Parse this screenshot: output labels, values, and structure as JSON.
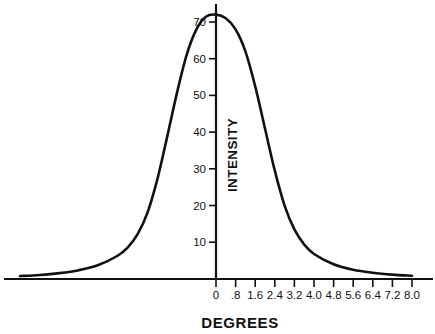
{
  "chart_data": {
    "type": "line",
    "title": "",
    "subtitle": "",
    "xlabel": "DEGREES",
    "ylabel": "INTENSITY",
    "xlim": [
      -8.0,
      8.0
    ],
    "ylim": [
      0,
      75
    ],
    "grid": false,
    "legend": null,
    "annotations": [],
    "line_color": "#111111",
    "axis_color": "#111111",
    "background_color": "#ffffff",
    "x_tick_labels": [
      "0",
      ".8",
      "1.6",
      "2.4",
      "3.2",
      "4.0",
      "4.8",
      "5.6",
      "6.4",
      "7.2",
      "8.0"
    ],
    "x_tick_values": [
      0,
      0.8,
      1.6,
      2.4,
      3.2,
      4.0,
      4.8,
      5.6,
      6.4,
      7.2,
      8.0
    ],
    "y_tick_labels": [
      "10",
      "20",
      "30",
      "40",
      "50",
      "60",
      "70"
    ],
    "y_tick_values": [
      10,
      20,
      30,
      40,
      50,
      60,
      70
    ],
    "series": [
      {
        "name": "intensity",
        "x": [
          -8.0,
          -7.2,
          -6.4,
          -5.6,
          -4.8,
          -4.0,
          -3.6,
          -3.2,
          -2.8,
          -2.4,
          -2.0,
          -1.6,
          -1.2,
          -0.8,
          -0.4,
          0,
          0.4,
          0.8,
          1.2,
          1.6,
          2.0,
          2.4,
          2.8,
          3.2,
          3.6,
          4.0,
          4.8,
          5.6,
          6.4,
          7.2,
          8.0
        ],
        "values": [
          0.8,
          1.1,
          1.6,
          2.4,
          3.8,
          6.4,
          8.6,
          12.2,
          18.0,
          27.0,
          38.5,
          50.5,
          61.0,
          68.0,
          71.5,
          72.0,
          71.0,
          68.0,
          62.0,
          52.5,
          41.0,
          29.5,
          20.0,
          13.5,
          9.4,
          6.8,
          4.0,
          2.5,
          1.7,
          1.2,
          0.9
        ]
      }
    ]
  },
  "axis": {
    "x_title": "DEGREES",
    "y_title": "INTENSITY"
  }
}
